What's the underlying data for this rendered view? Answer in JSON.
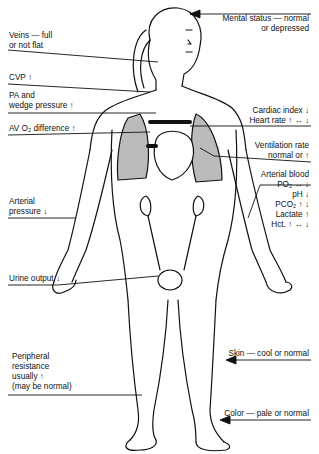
{
  "diagram": {
    "labels_left": [
      {
        "id": "veins",
        "lines": [
          "Veins — full",
          "or not flat"
        ]
      },
      {
        "id": "cvp",
        "lines": [
          "CVP ↑"
        ]
      },
      {
        "id": "pa",
        "lines": [
          "PA and",
          "wedge pressure ↑"
        ]
      },
      {
        "id": "avo2",
        "lines": [
          "AV O₂ difference ↑"
        ]
      },
      {
        "id": "arterial_pressure",
        "lines": [
          "Arterial",
          "pressure ↓"
        ]
      },
      {
        "id": "urine",
        "lines": [
          "Urine output ↓"
        ]
      },
      {
        "id": "peripheral",
        "lines": [
          "Peripheral",
          "resistance",
          "usually ↑",
          "(may be normal)"
        ]
      }
    ],
    "labels_right": [
      {
        "id": "mental",
        "lines": [
          "Mental status — normal",
          "or depressed"
        ]
      },
      {
        "id": "cardiac",
        "lines": [
          "Cardiac index ↓",
          "Heart rate ↑ ↔ ↓"
        ]
      },
      {
        "id": "ventilation",
        "lines": [
          "Ventilation rate",
          "normal or ↑"
        ]
      },
      {
        "id": "arterial_blood",
        "lines": [
          "Arterial blood",
          "PO₂ ↔ ↓",
          "pH ↓",
          "PCO₂ ↑ ↓",
          "Lactate ↑",
          "Hct. ↑ ↔ ↓"
        ]
      },
      {
        "id": "skin",
        "lines": [
          "Skin — cool or normal"
        ]
      },
      {
        "id": "color",
        "lines": [
          "Color — pale or normal"
        ]
      }
    ]
  }
}
